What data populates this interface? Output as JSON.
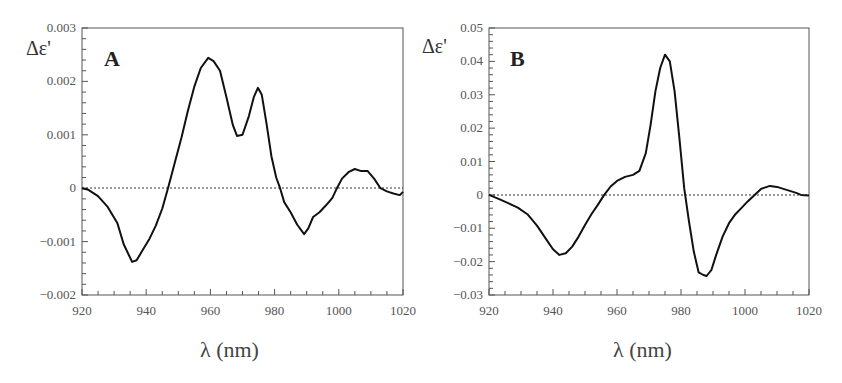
{
  "chart_data": [
    {
      "type": "line",
      "panel": "A",
      "title": "",
      "xlabel": "λ (nm)",
      "ylabel": "Δε'",
      "xlim": [
        920,
        1020
      ],
      "ylim": [
        -0.002,
        0.003
      ],
      "xticks": [
        "920",
        "940",
        "960",
        "980",
        "1000",
        "1020"
      ],
      "yticks": [
        "0.003",
        "0.002",
        "0.001",
        "0",
        "-0.001",
        "-0.002"
      ],
      "zero_line": "dotted",
      "grid": false,
      "series": [
        {
          "name": "A",
          "x": [
            920,
            922,
            925,
            928,
            931,
            933,
            935.6,
            937,
            939,
            941,
            943,
            945,
            946.8,
            949,
            951,
            953,
            955,
            957,
            959.3,
            961,
            963,
            965,
            967,
            968.3,
            970,
            972,
            973.5,
            974.8,
            976,
            977.5,
            979,
            980.5,
            981.7,
            983,
            985,
            987,
            989.2,
            990.5,
            992,
            994,
            996,
            998,
            999.4,
            1001,
            1003,
            1005,
            1007,
            1009,
            1011,
            1013,
            1015,
            1017,
            1019,
            1020
          ],
          "y": [
            0,
            -3e-05,
            -0.00015,
            -0.00035,
            -0.00065,
            -0.00105,
            -0.00138,
            -0.00135,
            -0.00115,
            -0.00095,
            -0.0007,
            -0.00038,
            0,
            0.0005,
            0.00095,
            0.00145,
            0.0019,
            0.00225,
            0.00244,
            0.00238,
            0.0022,
            0.0017,
            0.00118,
            0.00098,
            0.001,
            0.00135,
            0.0017,
            0.00188,
            0.00175,
            0.0012,
            0.0006,
            0.0002,
            0,
            -0.00026,
            -0.00045,
            -0.00068,
            -0.00086,
            -0.00075,
            -0.00054,
            -0.00045,
            -0.00032,
            -0.00018,
            0,
            0.00018,
            0.0003,
            0.00036,
            0.00032,
            0.00032,
            0.00018,
            0,
            -6e-05,
            -0.0001,
            -0.00013,
            -7e-05
          ]
        }
      ]
    },
    {
      "type": "line",
      "panel": "B",
      "title": "",
      "xlabel": "λ (nm)",
      "ylabel": "Δε'",
      "xlim": [
        920,
        1020
      ],
      "ylim": [
        -0.03,
        0.05
      ],
      "xticks": [
        "920",
        "940",
        "960",
        "980",
        "1000",
        "1020"
      ],
      "yticks": [
        "0.05",
        "0.04",
        "0.03",
        "0.02",
        "0.01",
        "0",
        "-0.01",
        "-0.02",
        "-0.03"
      ],
      "zero_line": "dotted",
      "grid": false,
      "series": [
        {
          "name": "B",
          "x": [
            920,
            923,
            926,
            929,
            932,
            935,
            938,
            940,
            942,
            944,
            946,
            948,
            950,
            952,
            954,
            956,
            958,
            960,
            962.5,
            965,
            967,
            969,
            970.5,
            972,
            973.5,
            975,
            976.5,
            978,
            979.5,
            981,
            982.5,
            984,
            985.5,
            987,
            988,
            989.5,
            991,
            993,
            995,
            997,
            999,
            1001,
            1003,
            1005,
            1007.8,
            1010,
            1013,
            1016,
            1017.5,
            1020
          ],
          "y": [
            0,
            -0.0012,
            -0.0025,
            -0.0038,
            -0.0058,
            -0.0092,
            -0.0135,
            -0.0163,
            -0.018,
            -0.0175,
            -0.0155,
            -0.0125,
            -0.009,
            -0.0058,
            -0.003,
            0,
            0.0025,
            0.0042,
            0.0054,
            0.006,
            0.0072,
            0.0125,
            0.021,
            0.031,
            0.038,
            0.042,
            0.04,
            0.031,
            0.017,
            0.002,
            -0.008,
            -0.017,
            -0.0232,
            -0.024,
            -0.0243,
            -0.0225,
            -0.018,
            -0.0125,
            -0.0085,
            -0.0058,
            -0.0038,
            -0.0018,
            0,
            0.0018,
            0.0027,
            0.0024,
            0.0015,
            0.0006,
            0,
            -0.0002
          ]
        }
      ]
    }
  ],
  "panels": {
    "A": {
      "label": "A",
      "ylabel": "Δε'",
      "xlabel": "λ (nm)"
    },
    "B": {
      "label": "B",
      "ylabel": "Δε'",
      "xlabel": "λ (nm)"
    }
  }
}
